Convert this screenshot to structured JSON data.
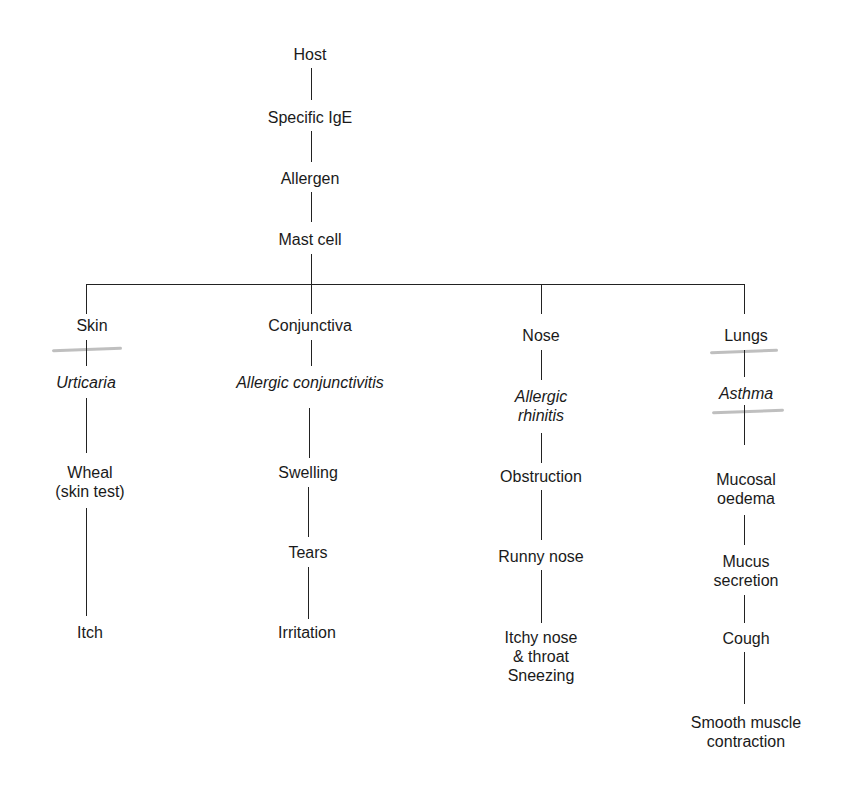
{
  "diagram": {
    "trunk": [
      "Host",
      "Specific IgE",
      "Allergen",
      "Mast cell"
    ],
    "branches": [
      {
        "organ": "Skin",
        "disease": "Urticaria",
        "effects": [
          "Wheal (skin test)",
          "Itch"
        ]
      },
      {
        "organ": "Conjunctiva",
        "disease": "Allergic conjunctivitis",
        "effects": [
          "Swelling",
          "Tears",
          "Irritation"
        ]
      },
      {
        "organ": "Nose",
        "disease": "Allergic rhinitis",
        "effects": [
          "Obstruction",
          "Runny nose",
          "Itchy nose & throat Sneezing"
        ]
      },
      {
        "organ": "Lungs",
        "disease": "Asthma",
        "effects": [
          "Mucosal oedema",
          "Mucus secretion",
          "Cough",
          "Smooth muscle contraction"
        ]
      }
    ]
  },
  "labels": {
    "host": "Host",
    "ige": "Specific IgE",
    "allergen": "Allergen",
    "mast": "Mast cell",
    "skin": "Skin",
    "urticaria": "Urticaria",
    "wheal1": "Wheal",
    "wheal2": "(skin test)",
    "itch": "Itch",
    "conj": "Conjunctiva",
    "conjunctivitis": "Allergic conjunctivitis",
    "swelling": "Swelling",
    "tears": "Tears",
    "irritation": "Irritation",
    "nose": "Nose",
    "rhinitis1": "Allergic",
    "rhinitis2": "rhinitis",
    "obstruction": "Obstruction",
    "runny": "Runny nose",
    "itchy1": "Itchy nose",
    "itchy2": "& throat",
    "itchy3": "Sneezing",
    "lungs": "Lungs",
    "asthma": "Asthma",
    "oedema1": "Mucosal",
    "oedema2": "oedema",
    "mucus1": "Mucus",
    "mucus2": "secretion",
    "cough": "Cough",
    "smooth1": "Smooth muscle",
    "smooth2": "contraction"
  }
}
